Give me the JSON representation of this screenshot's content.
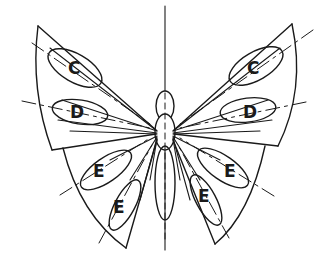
{
  "diagram": {
    "line_color": "#1a1a1a",
    "background": "#ffffff",
    "labels": {
      "left_forewing_upper": "C",
      "left_forewing_lower": "D",
      "left_hindwing_upper": "E",
      "left_hindwing_lower": "E",
      "right_forewing_upper": "C",
      "right_forewing_lower": "D",
      "right_hindwing_upper": "E",
      "right_hindwing_lower": "E"
    }
  }
}
